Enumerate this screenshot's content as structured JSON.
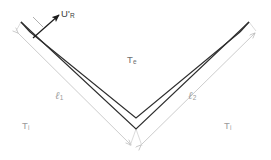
{
  "figure": {
    "background_color": "#ffffff",
    "wall_color": "#2e2e2e",
    "dimension_line_color": "#c3c3c3",
    "arrow_color": "#1c1c1c",
    "labels": {
      "velocity": {
        "base": "U",
        "prime": "'",
        "sub": "R",
        "color": "#3a3a3a"
      },
      "external_temp": {
        "base": "T",
        "sub": "e",
        "color": "#6e6e6e"
      },
      "length_1": {
        "base": "ℓ",
        "sub": "1",
        "color": "#8f8f8f"
      },
      "length_2": {
        "base": "ℓ",
        "sub": "2",
        "color": "#8f8f8f"
      },
      "internal_temp_left": {
        "base": "T",
        "sub": "i",
        "color": "#8f8f8f"
      },
      "internal_temp_right": {
        "base": "T",
        "sub": "i",
        "color": "#8f8f8f"
      }
    },
    "geometry": {
      "vertex_inner": [
        136,
        118
      ],
      "vertex_outer": [
        136,
        129
      ],
      "left_end_inner": [
        30,
        32
      ],
      "left_end_outer": [
        21,
        22
      ],
      "right_end_inner": [
        240,
        32
      ],
      "right_end_outer": [
        249,
        22
      ],
      "flow_arrow_start": [
        33,
        38
      ],
      "flow_arrow_end": [
        60,
        14
      ]
    }
  }
}
